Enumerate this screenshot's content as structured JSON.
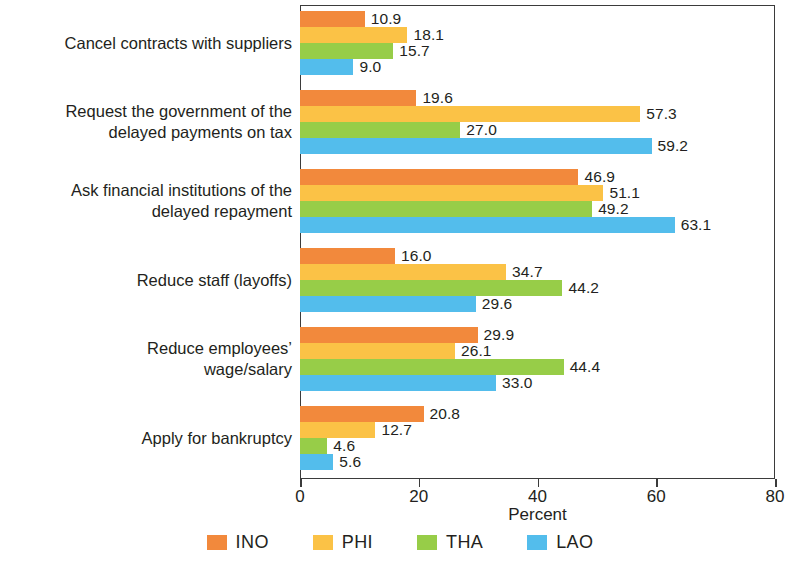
{
  "chart_data": {
    "type": "bar",
    "orientation": "horizontal",
    "title": "",
    "xlabel": "Percent",
    "ylabel": "",
    "xlim": [
      0,
      80
    ],
    "xticks": [
      "0",
      "20",
      "40",
      "60",
      "80"
    ],
    "grid": false,
    "legend_position": "bottom",
    "categories": [
      "Cancel contracts with suppliers",
      "Request the government of the\ndelayed payments on tax",
      "Ask financial institutions of the\ndelayed repayment",
      "Reduce staff (layoffs)",
      "Reduce employees’\nwage/salary",
      "Apply for bankruptcy"
    ],
    "series": [
      {
        "name": "INO",
        "color": "#f2893c",
        "values": [
          10.9,
          19.6,
          46.9,
          16.0,
          29.9,
          20.8
        ],
        "labels": [
          "10.9",
          "19.6",
          "46.9",
          "16.0",
          "29.9",
          "20.8"
        ]
      },
      {
        "name": "PHI",
        "color": "#fbc246",
        "values": [
          18.1,
          57.3,
          51.1,
          34.7,
          26.1,
          12.7
        ],
        "labels": [
          "18.1",
          "57.3",
          "51.1",
          "34.7",
          "26.1",
          "12.7"
        ]
      },
      {
        "name": "THA",
        "color": "#97cd48",
        "values": [
          15.7,
          27.0,
          49.2,
          44.2,
          44.4,
          4.6
        ],
        "labels": [
          "15.7",
          "27.0",
          "49.2",
          "44.2",
          "44.4",
          "4.6"
        ]
      },
      {
        "name": "LAO",
        "color": "#53bdec",
        "values": [
          9.0,
          59.2,
          63.1,
          29.6,
          33.0,
          5.6
        ],
        "labels": [
          "9.0",
          "59.2",
          "63.1",
          "29.6",
          "33.0",
          "5.6"
        ]
      }
    ]
  }
}
